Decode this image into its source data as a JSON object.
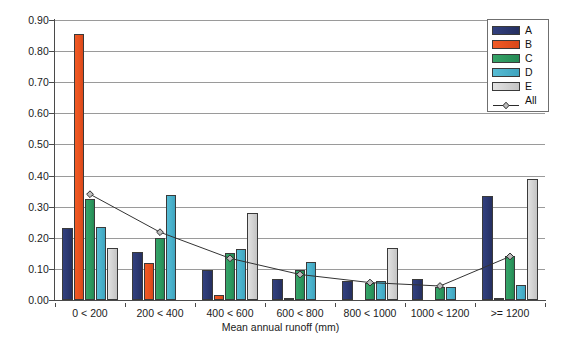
{
  "chart_data": {
    "type": "bar",
    "title": "",
    "xlabel": "Mean annual runoff (mm)",
    "ylabel": "",
    "ylim": [
      0.0,
      0.9
    ],
    "ytick_step": 0.1,
    "grid": true,
    "legend_position": "top-right",
    "categories": [
      "0 < 200",
      "200 < 400",
      "400 < 600",
      "600 < 800",
      "800 < 1000",
      "1000 < 1200",
      ">= 1200"
    ],
    "ytick_labels": [
      "0.00",
      "0.10",
      "0.20",
      "0.30",
      "0.40",
      "0.50",
      "0.60",
      "0.70",
      "0.80",
      "0.90"
    ],
    "series": [
      {
        "name": "A",
        "type": "bar",
        "color": "#2d3b7a",
        "values": [
          0.23,
          0.153,
          0.098,
          0.066,
          0.062,
          0.067,
          0.333
        ]
      },
      {
        "name": "B",
        "type": "bar",
        "color": "#ea5423",
        "values": [
          0.855,
          0.118,
          0.015,
          0.007,
          0.0,
          0.0,
          0.005
        ]
      },
      {
        "name": "C",
        "type": "bar",
        "color": "#2e9e62",
        "values": [
          0.325,
          0.2,
          0.152,
          0.097,
          0.055,
          0.042,
          0.14
        ]
      },
      {
        "name": "D",
        "type": "bar",
        "color": "#4ab3cc",
        "values": [
          0.235,
          0.337,
          0.165,
          0.123,
          0.062,
          0.042,
          0.048
        ]
      },
      {
        "name": "E",
        "type": "bar",
        "color": "#d4d4d4",
        "values": [
          0.167,
          0.0,
          0.28,
          0.0,
          0.167,
          0.0,
          0.39
        ]
      },
      {
        "name": "All",
        "type": "line",
        "color": "#333333",
        "marker": "diamond",
        "values": [
          0.34,
          0.218,
          0.134,
          0.082,
          0.056,
          0.045,
          0.14
        ]
      }
    ]
  },
  "legend": {
    "entries": [
      {
        "label": "A",
        "kind": "bar"
      },
      {
        "label": "B",
        "kind": "bar"
      },
      {
        "label": "C",
        "kind": "bar"
      },
      {
        "label": "D",
        "kind": "bar"
      },
      {
        "label": "E",
        "kind": "bar"
      },
      {
        "label": "All",
        "kind": "line"
      }
    ]
  },
  "axis": {
    "x_title": "Mean annual runoff (mm)"
  }
}
